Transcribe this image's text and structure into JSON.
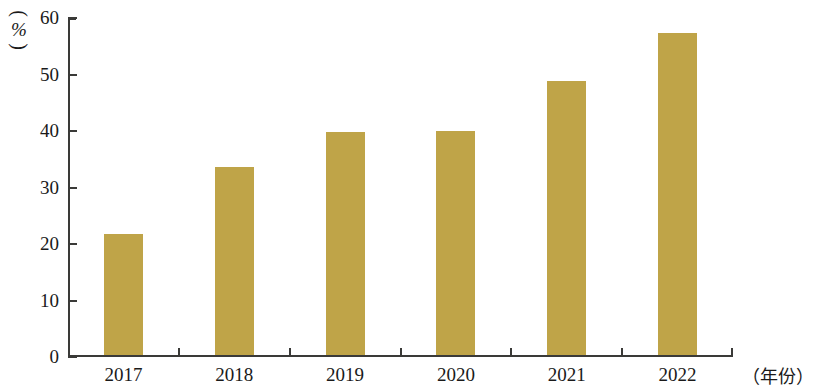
{
  "chart_data": {
    "type": "bar",
    "title": "",
    "subtitle": "",
    "xlabel": "（年份）",
    "ylabel": "（%）",
    "ylabel_unit": "%",
    "ylabel_open_paren": "︵",
    "ylabel_close_paren": "︶",
    "categories": [
      "2017",
      "2018",
      "2019",
      "2020",
      "2021",
      "2022"
    ],
    "values": [
      21.5,
      33.2,
      39.5,
      39.6,
      48.5,
      57.0
    ],
    "series": [
      {
        "name": "",
        "values": [
          21.5,
          33.2,
          39.5,
          39.6,
          48.5,
          57.0
        ]
      }
    ],
    "ylim": [
      0,
      60
    ],
    "xlim_note": "category axis",
    "yticks": [
      0,
      10,
      20,
      30,
      40,
      50,
      60
    ],
    "ytick_labels": [
      "0",
      "10",
      "20",
      "30",
      "40",
      "50",
      "60"
    ],
    "grid": false,
    "legend": false,
    "legend_position": "none",
    "bar_color": "#bfa448",
    "axis_color": "#3a3a38",
    "background_color": "#ffffff",
    "annotations": []
  }
}
